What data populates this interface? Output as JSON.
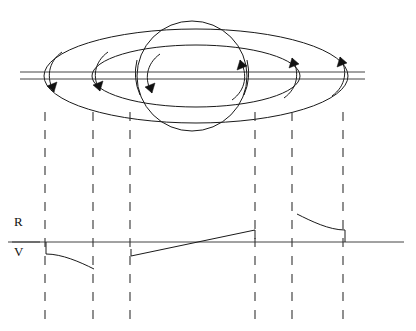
{
  "figure": {
    "name": "ringed-planet-rotation-spectrum",
    "background_color": "#ffffff",
    "ink_color": "#1a1a1a",
    "width": 416,
    "height": 331
  },
  "labels": {
    "red_shift": "R",
    "violet_shift": "V"
  },
  "planet": {
    "name": "planet-sphere",
    "center_x": 192,
    "center_y": 63,
    "radius": 55
  },
  "rings": {
    "outer": {
      "name": "outer-ring-ellipse",
      "center_x": 196,
      "center_y": 76,
      "radius_x": 152,
      "radius_y": 47
    },
    "inner": {
      "name": "inner-ring-ellipse",
      "center_x": 196,
      "center_y": 76,
      "radius_x": 104,
      "radius_y": 31
    }
  },
  "slit": {
    "name": "spectrograph-slit",
    "line_top_y": 72,
    "line_bottom_y": 79,
    "x_start": 20,
    "x_end": 365
  },
  "rotation_arrows": [
    {
      "name": "arrow-outer-left",
      "x": 52,
      "y": 86,
      "direction": "down-left",
      "side": "approaching"
    },
    {
      "name": "arrow-inner-left",
      "x": 98,
      "y": 85,
      "direction": "down-left",
      "side": "approaching"
    },
    {
      "name": "arrow-planet-left",
      "x": 150,
      "y": 86,
      "direction": "down-left",
      "side": "approaching"
    },
    {
      "name": "arrow-planet-right",
      "x": 241,
      "y": 66,
      "direction": "up-right",
      "side": "receding"
    },
    {
      "name": "arrow-inner-right",
      "x": 292,
      "y": 64,
      "direction": "up-right",
      "side": "receding"
    },
    {
      "name": "arrow-outer-right",
      "x": 340,
      "y": 63,
      "direction": "up-right",
      "side": "receding"
    }
  ],
  "projection_lines": [
    {
      "name": "projection-line-1",
      "x": 45,
      "y_top": 112,
      "y_bottom": 322
    },
    {
      "name": "projection-line-2",
      "x": 93,
      "y_top": 112,
      "y_bottom": 322
    },
    {
      "name": "projection-line-3",
      "x": 130,
      "y_top": 112,
      "y_bottom": 322
    },
    {
      "name": "projection-line-4",
      "x": 255,
      "y_top": 112,
      "y_bottom": 322
    },
    {
      "name": "projection-line-5",
      "x": 292,
      "y_top": 112,
      "y_bottom": 322
    },
    {
      "name": "projection-line-6",
      "x": 343,
      "y_top": 112,
      "y_bottom": 322
    }
  ],
  "spectrum_plot": {
    "name": "spectral-line-profile",
    "baseline_y": 242,
    "baseline_x_start": 8,
    "baseline_x_end": 404,
    "segments": [
      {
        "name": "ring-segment-left",
        "description": "Outer ring ansa, violet-shifted, decaying outward",
        "shift": "violet",
        "start": {
          "x": 46,
          "y": 242
        },
        "drop_to": {
          "x": 46,
          "y": 254
        },
        "curve_end": {
          "x": 94,
          "y": 269
        },
        "control": {
          "x": 70,
          "y": 269
        }
      },
      {
        "name": "planet-segment-ramp",
        "description": "Planet disk rotation, tilted line from violet to red",
        "shift": "both",
        "start": {
          "x": 131,
          "y": 256
        },
        "end": {
          "x": 255,
          "y": 230
        },
        "crossing_x": 195
      },
      {
        "name": "ring-segment-right",
        "description": "Outer ring ansa, red-shifted, decaying outward",
        "shift": "red",
        "start": {
          "x": 297,
          "y": 214
        },
        "curve_end": {
          "x": 345,
          "y": 230
        },
        "control": {
          "x": 322,
          "y": 230
        },
        "drop_to": {
          "x": 345,
          "y": 242
        }
      }
    ]
  }
}
